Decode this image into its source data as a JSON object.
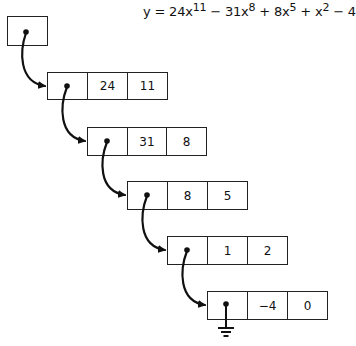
{
  "equation": {
    "lhs": "y",
    "terms": [
      {
        "sign": "",
        "coef": "24x",
        "exp": "11"
      },
      {
        "sign": "−",
        "coef": "31x",
        "exp": "8"
      },
      {
        "sign": "+",
        "coef": "8x",
        "exp": "5"
      },
      {
        "sign": "+",
        "coef": "x",
        "exp": "2"
      },
      {
        "sign": "−",
        "coef": "4",
        "exp": ""
      }
    ]
  },
  "head": {
    "label": "head pointer"
  },
  "nodes": [
    {
      "coef": "24",
      "exp": "11"
    },
    {
      "coef": "31",
      "exp": "8"
    },
    {
      "coef": "8",
      "exp": "5"
    },
    {
      "coef": "1",
      "exp": "2"
    },
    {
      "coef": "−4",
      "exp": "0"
    }
  ],
  "terminator": "null-ground",
  "colors": {
    "line": "#222222",
    "background": "#ffffff"
  }
}
